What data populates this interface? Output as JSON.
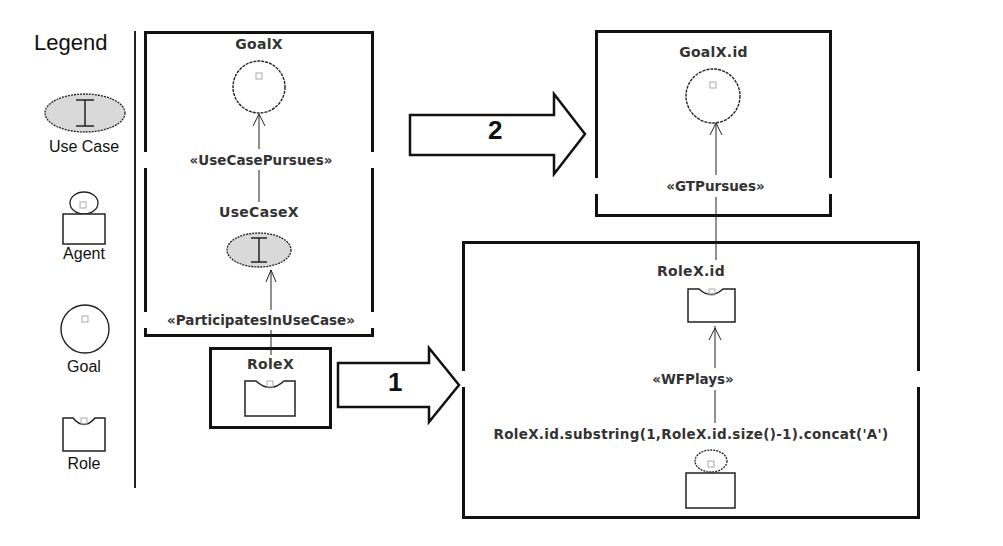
{
  "legend": {
    "title": "Legend",
    "items": [
      {
        "label": "Use Case",
        "icon": "use-case-icon"
      },
      {
        "label": "Agent",
        "icon": "agent-icon"
      },
      {
        "label": "Goal",
        "icon": "goal-icon"
      },
      {
        "label": "Role",
        "icon": "role-icon"
      }
    ]
  },
  "source_pattern": {
    "goal": {
      "label": "GoalX"
    },
    "use_case_pursues": "«UseCasePursues»",
    "use_case": {
      "label": "UseCaseX"
    },
    "participates": "«ParticipatesInUseCase»",
    "role": {
      "label": "RoleX"
    }
  },
  "transform_arrows": [
    {
      "number": "1"
    },
    {
      "number": "2"
    }
  ],
  "target_goal_box": {
    "goal": {
      "label": "GoalX.id"
    },
    "gt_pursues": "«GTPursues»"
  },
  "target_role_box": {
    "role": {
      "label": "RoleX.id"
    },
    "wf_plays": "«WFPlays»",
    "agent": {
      "label": "RoleX.id.substring(1,RoleX.id.size()-1).concat('A')"
    }
  },
  "colors": {
    "line": "#111111",
    "use_case_fill": "#d9d9d9",
    "text": "#333333",
    "background": "#ffffff"
  }
}
